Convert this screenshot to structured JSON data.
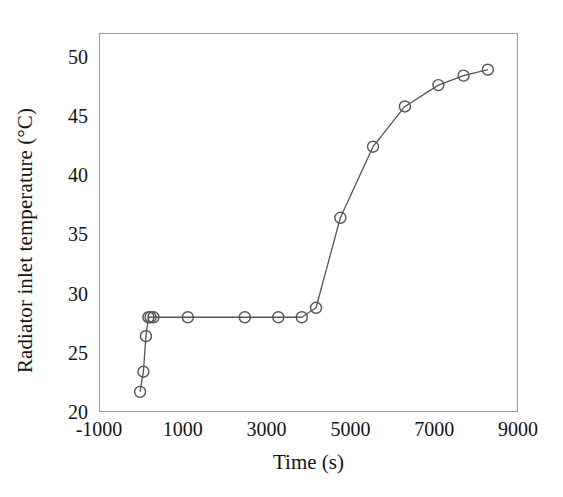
{
  "chart_data": {
    "type": "line",
    "title": "",
    "xlabel": "Time (s)",
    "ylabel": "Radiator inlet temperature (°C)",
    "xlim": [
      -1000,
      9000
    ],
    "ylim": [
      20,
      52
    ],
    "xticks": [
      -1000,
      1000,
      3000,
      5000,
      7000,
      9000
    ],
    "xtick_labels": [
      "-1000",
      "1000",
      "3000",
      "5000",
      "7000",
      "9000"
    ],
    "yticks": [
      20,
      25,
      30,
      35,
      40,
      45,
      50
    ],
    "ytick_labels": [
      "20",
      "25",
      "30",
      "35",
      "40",
      "45",
      "50"
    ],
    "grid": false,
    "legend": false,
    "marker": "open-circle",
    "marker_size": 11,
    "line_color": "#555555",
    "marker_color": "#555555",
    "axis_color": "#9a9a9a",
    "background": "#ffffff",
    "series": [
      {
        "name": "Radiator inlet temperature",
        "x": [
          -20,
          60,
          120,
          180,
          230,
          300,
          1120,
          2480,
          3280,
          3840,
          4180,
          4760,
          5540,
          6300,
          7100,
          7700,
          8280
        ],
        "y": [
          21.7,
          23.4,
          26.4,
          28.0,
          28.0,
          28.0,
          28.0,
          28.0,
          28.0,
          28.0,
          28.8,
          36.4,
          42.4,
          45.8,
          47.6,
          48.4,
          48.9
        ]
      }
    ]
  },
  "axes": {
    "x_title": "Time (s)",
    "y_title": "Radiator inlet temperature (°C)"
  }
}
